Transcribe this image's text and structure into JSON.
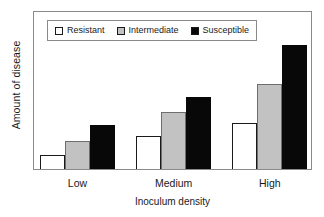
{
  "chart_data": {
    "type": "bar",
    "title": "",
    "xlabel": "Inoculum density",
    "ylabel": "Amount of disease",
    "categories": [
      "Low",
      "Medium",
      "High"
    ],
    "series": [
      {
        "name": "Resistant",
        "color": "#ffffff",
        "edge_color": "#1a1a1a",
        "swatch": "white-square-swatch",
        "values": [
          9,
          21,
          29
        ]
      },
      {
        "name": "Intermediate",
        "color": "#c2c2c2",
        "edge_color": "#6e6e6e",
        "swatch": "gray-square-swatch",
        "values": [
          18,
          36,
          54
        ]
      },
      {
        "name": "Susceptible",
        "color": "#080808",
        "edge_color": "#080808",
        "swatch": "black-square-swatch",
        "values": [
          28,
          46,
          79
        ]
      }
    ],
    "ylim": [
      0,
      100
    ],
    "yticks": [],
    "ytick_labels": [],
    "grid": false,
    "legend_position": "upper-left-inside",
    "axis_frame": true
  },
  "legend": {
    "entries": [
      {
        "label": "Resistant"
      },
      {
        "label": "Intermediate"
      },
      {
        "label": "Susceptible"
      }
    ]
  },
  "axes": {
    "y_title": "Amount of disease",
    "x_title": "Inoculum density",
    "x_tick_labels": [
      "Low",
      "Medium",
      "High"
    ]
  },
  "colors": {
    "frame": "#8a8a8a",
    "text": "#1a1a1a",
    "background": "#ffffff",
    "resistant": "#ffffff",
    "intermediate": "#c2c2c2",
    "susceptible": "#080808"
  }
}
